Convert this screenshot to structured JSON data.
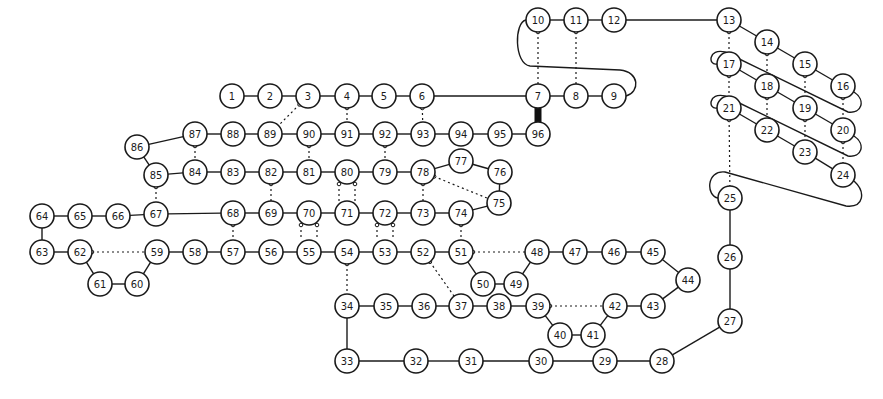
{
  "diagram": {
    "title": "",
    "node_radius": 12,
    "colors": {
      "stroke": "#1a1a1a",
      "fill": "#ffffff",
      "background": "#ffffff"
    },
    "nodes": [
      {
        "id": "1",
        "x": 232,
        "y": 96
      },
      {
        "id": "2",
        "x": 270,
        "y": 96
      },
      {
        "id": "3",
        "x": 308,
        "y": 96
      },
      {
        "id": "4",
        "x": 347,
        "y": 96
      },
      {
        "id": "5",
        "x": 384,
        "y": 96
      },
      {
        "id": "6",
        "x": 422,
        "y": 96
      },
      {
        "id": "7",
        "x": 538,
        "y": 96
      },
      {
        "id": "8",
        "x": 576,
        "y": 96
      },
      {
        "id": "9",
        "x": 614,
        "y": 96
      },
      {
        "id": "10",
        "x": 538,
        "y": 20
      },
      {
        "id": "11",
        "x": 576,
        "y": 20
      },
      {
        "id": "12",
        "x": 614,
        "y": 20
      },
      {
        "id": "13",
        "x": 729,
        "y": 20
      },
      {
        "id": "14",
        "x": 767,
        "y": 42
      },
      {
        "id": "15",
        "x": 805,
        "y": 64
      },
      {
        "id": "16",
        "x": 843,
        "y": 86
      },
      {
        "id": "17",
        "x": 729,
        "y": 64
      },
      {
        "id": "18",
        "x": 767,
        "y": 86
      },
      {
        "id": "19",
        "x": 805,
        "y": 108
      },
      {
        "id": "20",
        "x": 843,
        "y": 130
      },
      {
        "id": "21",
        "x": 729,
        "y": 108
      },
      {
        "id": "22",
        "x": 767,
        "y": 130
      },
      {
        "id": "23",
        "x": 805,
        "y": 152
      },
      {
        "id": "24",
        "x": 843,
        "y": 175
      },
      {
        "id": "25",
        "x": 730,
        "y": 198
      },
      {
        "id": "26",
        "x": 730,
        "y": 257
      },
      {
        "id": "27",
        "x": 730,
        "y": 321
      },
      {
        "id": "28",
        "x": 662,
        "y": 361
      },
      {
        "id": "29",
        "x": 605,
        "y": 361
      },
      {
        "id": "30",
        "x": 541,
        "y": 361
      },
      {
        "id": "31",
        "x": 471,
        "y": 361
      },
      {
        "id": "32",
        "x": 416,
        "y": 361
      },
      {
        "id": "33",
        "x": 347,
        "y": 361
      },
      {
        "id": "34",
        "x": 347,
        "y": 306
      },
      {
        "id": "35",
        "x": 386,
        "y": 306
      },
      {
        "id": "36",
        "x": 424,
        "y": 306
      },
      {
        "id": "37",
        "x": 461,
        "y": 306
      },
      {
        "id": "38",
        "x": 499,
        "y": 306
      },
      {
        "id": "39",
        "x": 538,
        "y": 306
      },
      {
        "id": "40",
        "x": 560,
        "y": 335
      },
      {
        "id": "41",
        "x": 593,
        "y": 335
      },
      {
        "id": "42",
        "x": 615,
        "y": 306
      },
      {
        "id": "43",
        "x": 653,
        "y": 306
      },
      {
        "id": "44",
        "x": 688,
        "y": 280
      },
      {
        "id": "45",
        "x": 653,
        "y": 252
      },
      {
        "id": "46",
        "x": 614,
        "y": 252
      },
      {
        "id": "47",
        "x": 575,
        "y": 252
      },
      {
        "id": "48",
        "x": 537,
        "y": 252
      },
      {
        "id": "49",
        "x": 516,
        "y": 284
      },
      {
        "id": "50",
        "x": 483,
        "y": 284
      },
      {
        "id": "51",
        "x": 461,
        "y": 252
      },
      {
        "id": "52",
        "x": 423,
        "y": 252
      },
      {
        "id": "53",
        "x": 385,
        "y": 252
      },
      {
        "id": "54",
        "x": 347,
        "y": 252
      },
      {
        "id": "55",
        "x": 309,
        "y": 252
      },
      {
        "id": "56",
        "x": 271,
        "y": 252
      },
      {
        "id": "57",
        "x": 233,
        "y": 252
      },
      {
        "id": "58",
        "x": 195,
        "y": 252
      },
      {
        "id": "59",
        "x": 157,
        "y": 252
      },
      {
        "id": "60",
        "x": 137,
        "y": 284
      },
      {
        "id": "61",
        "x": 100,
        "y": 284
      },
      {
        "id": "62",
        "x": 80,
        "y": 252
      },
      {
        "id": "63",
        "x": 42,
        "y": 252
      },
      {
        "id": "64",
        "x": 42,
        "y": 216
      },
      {
        "id": "65",
        "x": 80,
        "y": 216
      },
      {
        "id": "66",
        "x": 118,
        "y": 216
      },
      {
        "id": "67",
        "x": 156,
        "y": 214
      },
      {
        "id": "68",
        "x": 233,
        "y": 213
      },
      {
        "id": "69",
        "x": 271,
        "y": 213
      },
      {
        "id": "70",
        "x": 309,
        "y": 213
      },
      {
        "id": "71",
        "x": 347,
        "y": 213
      },
      {
        "id": "72",
        "x": 385,
        "y": 213
      },
      {
        "id": "73",
        "x": 423,
        "y": 213
      },
      {
        "id": "74",
        "x": 461,
        "y": 213
      },
      {
        "id": "75",
        "x": 499,
        "y": 203
      },
      {
        "id": "76",
        "x": 500,
        "y": 172
      },
      {
        "id": "77",
        "x": 461,
        "y": 161
      },
      {
        "id": "78",
        "x": 423,
        "y": 172
      },
      {
        "id": "79",
        "x": 385,
        "y": 172
      },
      {
        "id": "80",
        "x": 347,
        "y": 172
      },
      {
        "id": "81",
        "x": 309,
        "y": 172
      },
      {
        "id": "82",
        "x": 271,
        "y": 172
      },
      {
        "id": "83",
        "x": 233,
        "y": 172
      },
      {
        "id": "84",
        "x": 195,
        "y": 172
      },
      {
        "id": "85",
        "x": 156,
        "y": 175
      },
      {
        "id": "86",
        "x": 137,
        "y": 147
      },
      {
        "id": "87",
        "x": 195,
        "y": 134
      },
      {
        "id": "88",
        "x": 233,
        "y": 134
      },
      {
        "id": "89",
        "x": 270,
        "y": 134
      },
      {
        "id": "90",
        "x": 309,
        "y": 134
      },
      {
        "id": "91",
        "x": 347,
        "y": 134
      },
      {
        "id": "92",
        "x": 385,
        "y": 134
      },
      {
        "id": "93",
        "x": 423,
        "y": 134
      },
      {
        "id": "94",
        "x": 461,
        "y": 134
      },
      {
        "id": "95",
        "x": 500,
        "y": 134
      },
      {
        "id": "96",
        "x": 538,
        "y": 134
      }
    ],
    "solid_edges": [
      [
        "1",
        "2"
      ],
      [
        "2",
        "3"
      ],
      [
        "3",
        "4"
      ],
      [
        "4",
        "5"
      ],
      [
        "5",
        "6"
      ],
      [
        "6",
        "7"
      ],
      [
        "7",
        "8"
      ],
      [
        "8",
        "9"
      ],
      [
        "10",
        "11"
      ],
      [
        "11",
        "12"
      ],
      [
        "12",
        "13"
      ],
      [
        "13",
        "14"
      ],
      [
        "14",
        "15"
      ],
      [
        "15",
        "16"
      ],
      [
        "17",
        "18"
      ],
      [
        "18",
        "19"
      ],
      [
        "19",
        "20"
      ],
      [
        "21",
        "22"
      ],
      [
        "22",
        "23"
      ],
      [
        "23",
        "24"
      ],
      [
        "25",
        "26"
      ],
      [
        "26",
        "27"
      ],
      [
        "27",
        "28"
      ],
      [
        "28",
        "29"
      ],
      [
        "29",
        "30"
      ],
      [
        "30",
        "31"
      ],
      [
        "31",
        "32"
      ],
      [
        "32",
        "33"
      ],
      [
        "33",
        "34"
      ],
      [
        "34",
        "35"
      ],
      [
        "35",
        "36"
      ],
      [
        "36",
        "37"
      ],
      [
        "37",
        "38"
      ],
      [
        "38",
        "39"
      ],
      [
        "39",
        "40"
      ],
      [
        "40",
        "41"
      ],
      [
        "41",
        "42"
      ],
      [
        "42",
        "43"
      ],
      [
        "43",
        "44"
      ],
      [
        "44",
        "45"
      ],
      [
        "45",
        "46"
      ],
      [
        "46",
        "47"
      ],
      [
        "47",
        "48"
      ],
      [
        "48",
        "49"
      ],
      [
        "49",
        "50"
      ],
      [
        "50",
        "51"
      ],
      [
        "51",
        "52"
      ],
      [
        "52",
        "53"
      ],
      [
        "53",
        "54"
      ],
      [
        "54",
        "55"
      ],
      [
        "55",
        "56"
      ],
      [
        "56",
        "57"
      ],
      [
        "57",
        "58"
      ],
      [
        "58",
        "59"
      ],
      [
        "59",
        "60"
      ],
      [
        "60",
        "61"
      ],
      [
        "61",
        "62"
      ],
      [
        "62",
        "63"
      ],
      [
        "63",
        "64"
      ],
      [
        "64",
        "65"
      ],
      [
        "65",
        "66"
      ],
      [
        "66",
        "67"
      ],
      [
        "67",
        "68"
      ],
      [
        "68",
        "69"
      ],
      [
        "69",
        "70"
      ],
      [
        "70",
        "71"
      ],
      [
        "71",
        "72"
      ],
      [
        "72",
        "73"
      ],
      [
        "73",
        "74"
      ],
      [
        "74",
        "75"
      ],
      [
        "75",
        "76"
      ],
      [
        "76",
        "77"
      ],
      [
        "77",
        "78"
      ],
      [
        "78",
        "79"
      ],
      [
        "79",
        "80"
      ],
      [
        "80",
        "81"
      ],
      [
        "81",
        "82"
      ],
      [
        "82",
        "83"
      ],
      [
        "83",
        "84"
      ],
      [
        "84",
        "85"
      ],
      [
        "85",
        "86"
      ],
      [
        "86",
        "87"
      ],
      [
        "87",
        "88"
      ],
      [
        "88",
        "89"
      ],
      [
        "89",
        "90"
      ],
      [
        "90",
        "91"
      ],
      [
        "91",
        "92"
      ],
      [
        "92",
        "93"
      ],
      [
        "93",
        "94"
      ],
      [
        "94",
        "95"
      ],
      [
        "95",
        "96"
      ]
    ],
    "dashed_edges": [
      [
        "3",
        "89"
      ],
      [
        "4",
        "91"
      ],
      [
        "6",
        "93"
      ],
      [
        "10",
        "7"
      ],
      [
        "11",
        "8"
      ],
      [
        "13",
        "17"
      ],
      [
        "17",
        "21"
      ],
      [
        "21",
        "25"
      ],
      [
        "14",
        "18"
      ],
      [
        "18",
        "22"
      ],
      [
        "15",
        "19"
      ],
      [
        "19",
        "23"
      ],
      [
        "16",
        "20"
      ],
      [
        "20",
        "24"
      ],
      [
        "87",
        "84"
      ],
      [
        "90",
        "81"
      ],
      [
        "92",
        "79"
      ],
      [
        "85",
        "67"
      ],
      [
        "82",
        "69"
      ],
      [
        "68",
        "57"
      ],
      [
        "80",
        "71"
      ],
      [
        "80",
        "71b"
      ],
      [
        "78",
        "73"
      ],
      [
        "78",
        "75"
      ],
      [
        "70",
        "55"
      ],
      [
        "70",
        "55b"
      ],
      [
        "72",
        "53"
      ],
      [
        "72",
        "53b"
      ],
      [
        "74",
        "51"
      ],
      [
        "51",
        "48"
      ],
      [
        "62",
        "59"
      ],
      [
        "54",
        "34"
      ],
      [
        "52",
        "37"
      ],
      [
        "39",
        "42"
      ]
    ],
    "thick_edges": [
      [
        "7",
        "96"
      ]
    ],
    "loops": [
      "9-to-10",
      "16-to-17",
      "20-to-21",
      "24-to-25"
    ]
  }
}
